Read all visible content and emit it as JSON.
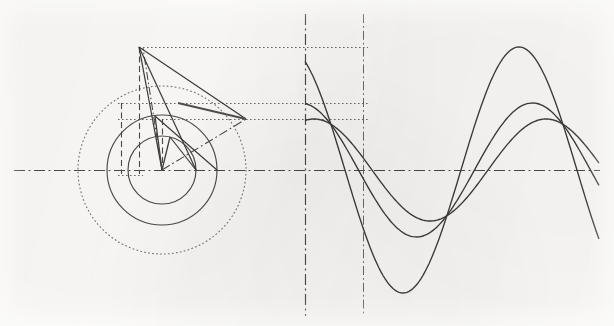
{
  "figure": {
    "kind": "geometric-construction",
    "canvas": {
      "width": 614,
      "height": 326,
      "background": "#fbfaf8"
    },
    "ink_color": "#3b3b3b",
    "ink_color_light": "#6d6d6d"
  },
  "chart_data": {
    "type": "line",
    "subtitle": "Three concentric phasor circles projected into three sinusoids",
    "xlabel": "",
    "ylabel": "",
    "grid": false,
    "legend_position": "none",
    "axes": {
      "baseline_y": 170,
      "phasor_center": {
        "x": 162,
        "y": 170
      },
      "wave_origin_x": 305,
      "wave_end_x": 600,
      "period_px": 232,
      "quarter_marker_x": 363
    },
    "annotations": [
      {
        "name": "baseline-axis",
        "style": "dash-dot",
        "orientation": "horizontal",
        "y": 170,
        "x1": 14,
        "x2": 600
      },
      {
        "name": "wave-origin-axis",
        "style": "dash-dot",
        "orientation": "vertical",
        "x": 305,
        "y1": 14,
        "y2": 316
      },
      {
        "name": "quarter-axis",
        "style": "dash-dot",
        "orientation": "vertical",
        "x": 363,
        "y1": 14,
        "y2": 316
      },
      {
        "name": "projection-peak-a",
        "style": "dotted",
        "orientation": "horizontal",
        "y": 47,
        "x1": 139,
        "x2": 368
      },
      {
        "name": "projection-peak-b",
        "style": "dotted",
        "orientation": "horizontal",
        "y": 103,
        "x1": 118,
        "x2": 368
      },
      {
        "name": "projection-peak-c",
        "style": "dotted",
        "orientation": "horizontal",
        "y": 119,
        "x1": 118,
        "x2": 368
      },
      {
        "name": "drop-line-a",
        "style": "dashed",
        "orientation": "vertical",
        "x": 139,
        "y1": 47,
        "y2": 174
      },
      {
        "name": "drop-line-b",
        "style": "dashed",
        "orientation": "vertical",
        "x": 121,
        "y1": 103,
        "y2": 174
      },
      {
        "name": "drop-line-c",
        "style": "dashed",
        "orientation": "vertical",
        "x": 162,
        "y1": 119,
        "y2": 170
      }
    ],
    "circles": [
      {
        "name": "outer-circle",
        "cx": 162,
        "cy": 170,
        "r": 84,
        "style": "dotted",
        "amplitude": 123
      },
      {
        "name": "middle-circle",
        "cx": 162,
        "cy": 170,
        "r": 55,
        "style": "solid",
        "amplitude": 67
      },
      {
        "name": "inner-circle",
        "cx": 162,
        "cy": 170,
        "r": 34,
        "style": "solid",
        "amplitude": 51
      }
    ],
    "phasors": [
      {
        "name": "phasor-outer",
        "style": "solid",
        "angle_deg": 118,
        "from": {
          "x": 162,
          "y": 170
        },
        "to": {
          "x": 139,
          "y": 47
        }
      },
      {
        "name": "phasor-middle",
        "style": "solid",
        "angle_deg": 97,
        "from": {
          "x": 162,
          "y": 170
        },
        "to": {
          "x": 155,
          "y": 116
        }
      },
      {
        "name": "phasor-inner",
        "style": "solid",
        "angle_deg": 76,
        "from": {
          "x": 162,
          "y": 170
        },
        "to": {
          "x": 170,
          "y": 137
        }
      },
      {
        "name": "phasor-resultant",
        "style": "dash-dot",
        "angle_deg": 31,
        "from": {
          "x": 162,
          "y": 170
        },
        "to": {
          "x": 246,
          "y": 119
        }
      },
      {
        "name": "phasor-axis-dashdot",
        "style": "dash-dot",
        "angle_deg": 103,
        "from": {
          "x": 162,
          "y": 170
        },
        "to": {
          "x": 143,
          "y": 48
        }
      }
    ],
    "chords": [
      {
        "name": "chord-outer-upper",
        "from": {
          "x": 139,
          "y": 47
        },
        "to": {
          "x": 246,
          "y": 119
        }
      },
      {
        "name": "chord-outer-lower",
        "from": {
          "x": 139,
          "y": 47
        },
        "to": {
          "x": 196,
          "y": 170
        }
      },
      {
        "name": "chord-mid-right",
        "from": {
          "x": 155,
          "y": 116
        },
        "to": {
          "x": 217,
          "y": 170
        }
      },
      {
        "name": "chord-inner-right",
        "from": {
          "x": 170,
          "y": 137
        },
        "to": {
          "x": 196,
          "y": 170
        }
      },
      {
        "name": "projection-bar-upper",
        "from": {
          "x": 178,
          "y": 103
        },
        "to": {
          "x": 246,
          "y": 119
        }
      }
    ],
    "series": [
      {
        "name": "wave-large",
        "amplitude_px": 123,
        "phase_deg": 118,
        "period_px": 232,
        "style": "solid",
        "peak": {
          "x": 363,
          "y": 47
        },
        "trough": {
          "x": 479,
          "y": 293
        },
        "start": {
          "x": 305,
          "y": 170
        }
      },
      {
        "name": "wave-medium",
        "amplitude_px": 67,
        "phase_deg": 97,
        "period_px": 232,
        "style": "solid",
        "peak": {
          "x": 342,
          "y": 103
        },
        "trough": {
          "x": 458,
          "y": 237
        },
        "start": {
          "x": 305,
          "y": 103
        }
      },
      {
        "name": "wave-small",
        "amplitude_px": 51,
        "phase_deg": 76,
        "period_px": 232,
        "style": "solid",
        "peak": {
          "x": 368,
          "y": 119
        },
        "trough": {
          "x": 484,
          "y": 221
        },
        "start": {
          "x": 305,
          "y": 120
        }
      }
    ]
  }
}
